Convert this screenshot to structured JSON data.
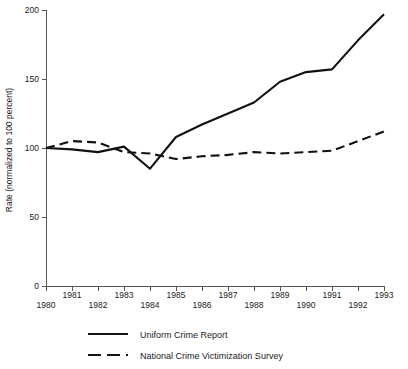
{
  "chart_data": {
    "type": "line",
    "title": "",
    "xlabel": "",
    "ylabel": "Rate (normalized to 100 percent)",
    "xlim": [
      1980,
      1993
    ],
    "ylim": [
      0,
      200
    ],
    "grid": false,
    "legend_position": "bottom",
    "x": [
      1980,
      1981,
      1982,
      1983,
      1984,
      1985,
      1986,
      1987,
      1988,
      1989,
      1990,
      1991,
      1992,
      1993
    ],
    "xtick_labels": [
      "1980",
      "1981",
      "1982",
      "1983",
      "1984",
      "1985",
      "1986",
      "1987",
      "1988",
      "1989",
      "1990",
      "1991",
      "1992",
      "1993"
    ],
    "ytick_values": [
      0,
      50,
      100,
      150,
      200
    ],
    "ytick_labels": [
      "0",
      "50",
      "100",
      "150",
      "200"
    ],
    "series": [
      {
        "name": "Uniform Crime Report",
        "style": "solid",
        "color": "#111111",
        "values": [
          100,
          99,
          97,
          101,
          85,
          108,
          117,
          125,
          133,
          148,
          155,
          157,
          178,
          197
        ]
      },
      {
        "name": "National Crime Victimization Survey",
        "style": "dashed",
        "color": "#111111",
        "values": [
          100,
          105,
          104,
          97,
          96,
          92,
          94,
          95,
          97,
          96,
          97,
          98,
          105,
          112
        ]
      }
    ]
  },
  "legend": {
    "entries": [
      {
        "label": "Uniform Crime Report",
        "style": "solid"
      },
      {
        "label": "National Crime Victimization Survey",
        "style": "dashed"
      }
    ]
  }
}
